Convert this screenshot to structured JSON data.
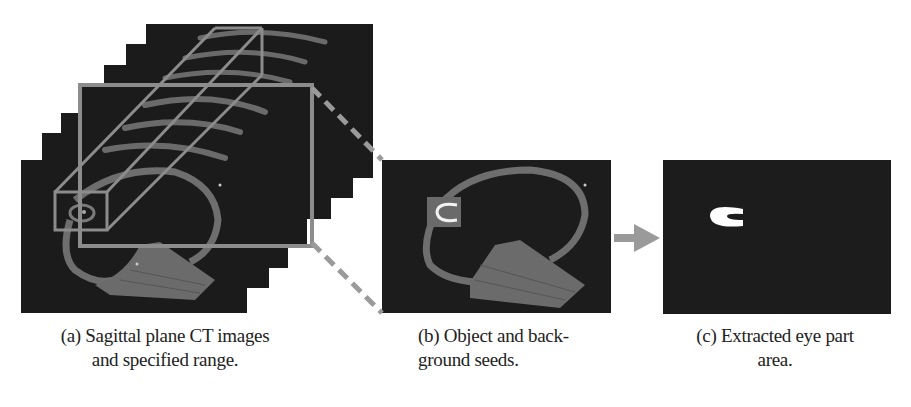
{
  "figure": {
    "panels": [
      {
        "id": "a",
        "description": "Stacked sagittal CT slices with a rectangular prism marking the specified range around the eye",
        "caption_line1": "(a) Sagittal plane CT images",
        "caption_line2": "and specified range."
      },
      {
        "id": "b",
        "description": "Single sagittal slice with object and background seeds highlighted around the eye",
        "caption_line1": "(b) Object and back-",
        "caption_line2": "ground seeds."
      },
      {
        "id": "c",
        "description": "Binary mask showing the extracted eye region as a white C-shape",
        "caption_line1": "(c) Extracted eye part",
        "caption_line2": "area."
      }
    ],
    "connectors": {
      "zoom_lines": "dashed gray lines from (a) to (b)",
      "arrow": "gray arrow from (b) to (c)"
    },
    "colors": {
      "background": "#ffffff",
      "ct_background": "#1b1b1b",
      "anatomy_gray": "#6e6e6e",
      "frame_gray": "#8c8c8c",
      "mask_white": "#ffffff",
      "caption_text": "#222222"
    }
  }
}
